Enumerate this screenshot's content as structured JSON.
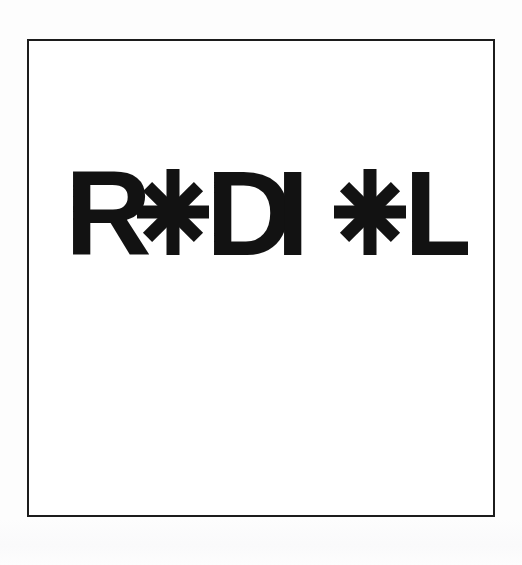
{
  "canvas": {
    "width": 522,
    "height": 565,
    "background_color": "#fdfdfd"
  },
  "frame": {
    "name": "plate-border",
    "stroke_color": "#1c1c1c",
    "stroke_width": 2,
    "fill_color": "#ffffff",
    "x": 27,
    "y": 39,
    "width": 468,
    "height": 478
  },
  "wordmark": {
    "reads_as": "RADIAL",
    "rendered_text": "R✳DI✳L",
    "ink_color": "#121212",
    "cap_height_px": 86,
    "baseline_y": 253,
    "left_x": 66,
    "right_x": 462,
    "segments": [
      {
        "kind": "letter",
        "char": "R",
        "label": "letter-R"
      },
      {
        "kind": "asterisk",
        "char": "✳",
        "label": "asterisk-glyph-1",
        "stands_for": "A",
        "points": 8
      },
      {
        "kind": "letter",
        "char": "D",
        "label": "letter-D"
      },
      {
        "kind": "letter",
        "char": "I",
        "label": "letter-I"
      },
      {
        "kind": "asterisk",
        "char": "✳",
        "label": "asterisk-glyph-2",
        "stands_for": "A",
        "points": 8
      },
      {
        "kind": "letter",
        "char": "L",
        "label": "letter-L"
      }
    ],
    "letters": {
      "r": "R",
      "d": "D",
      "i": "I",
      "l": "L"
    },
    "asterisk": {
      "points": 8,
      "arm_count": 4,
      "arm_angles_deg": [
        0,
        45,
        90,
        135
      ],
      "bar_thickness_px": 13,
      "radius_px": 36,
      "vertical_radius_px": 43,
      "center_1_x": 171,
      "center_2_x": 368,
      "center_y": 210
    }
  }
}
